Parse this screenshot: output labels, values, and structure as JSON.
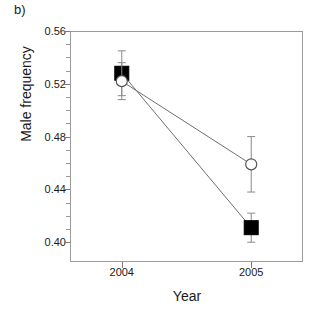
{
  "panel": {
    "label": "b)"
  },
  "chart_data": {
    "type": "line",
    "title": "",
    "subtitle": "",
    "xlabel": "Year",
    "ylabel": "Male frequency",
    "categories": [
      "2004",
      "2005"
    ],
    "x": [
      2004,
      2005
    ],
    "xlim": [
      2003.6,
      2005.4
    ],
    "ylim": [
      0.385,
      0.56
    ],
    "yticks": [
      0.4,
      0.44,
      0.48,
      0.52,
      0.56
    ],
    "ytick_labels": [
      "0.40",
      "0.44",
      "0.48",
      "0.52",
      "0.56"
    ],
    "yminorticks": [
      0.4,
      0.41,
      0.42,
      0.43,
      0.44,
      0.45,
      0.46,
      0.47,
      0.48,
      0.49,
      0.5,
      0.51,
      0.52,
      0.53,
      0.54,
      0.55,
      0.56
    ],
    "xtick_labels": [
      "2004",
      "2005"
    ],
    "grid": false,
    "legend": "none",
    "error_bars": "symmetric",
    "series": [
      {
        "name": "filled-square-series",
        "marker": "filled-square",
        "color": "#000000",
        "values": [
          0.528,
          0.411
        ],
        "errors": [
          0.017,
          0.011
        ],
        "lower": [
          0.511,
          0.4
        ],
        "upper": [
          0.545,
          0.422
        ]
      },
      {
        "name": "open-circle-series",
        "marker": "open-circle",
        "color": "#555555",
        "values": [
          0.522,
          0.459
        ],
        "errors": [
          0.014,
          0.021
        ],
        "lower": [
          0.508,
          0.438
        ],
        "upper": [
          0.536,
          0.48
        ]
      }
    ],
    "annotations": []
  },
  "colors": {
    "axis": "#9a9a9a",
    "tick": "#7a7a7a",
    "text": "#1a1a1a",
    "series_filled": "#000000",
    "series_open": "#555555"
  }
}
